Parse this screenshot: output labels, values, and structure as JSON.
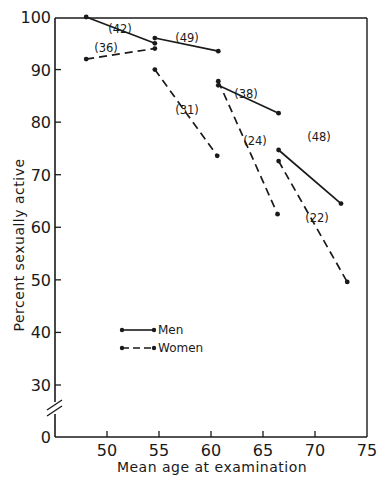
{
  "chart_data": {
    "type": "line",
    "title": "",
    "xlabel": "Mean age at examination",
    "ylabel": "Percent sexually active",
    "xlim": [
      45,
      75
    ],
    "ylim": [
      0,
      100
    ],
    "y_axis_break": "between 0 and 30",
    "x_ticks": [
      50,
      55,
      60,
      65,
      70,
      75
    ],
    "y_ticks": [
      0,
      30,
      40,
      50,
      60,
      70,
      80,
      90,
      100
    ],
    "grid": false,
    "legend_position": "lower left inside plot",
    "legend": [
      {
        "name": "Men",
        "style": "solid"
      },
      {
        "name": "Women",
        "style": "dashed"
      }
    ],
    "series": [
      {
        "name": "Men",
        "style": "solid",
        "segments": [
          {
            "label": "(42)",
            "points": [
              [
                48.0,
                100.0
              ],
              [
                54.6,
                95.0
              ]
            ]
          },
          {
            "label": "(49)",
            "points": [
              [
                54.6,
                96.0
              ],
              [
                60.7,
                93.5
              ]
            ]
          },
          {
            "label": "(38)",
            "points": [
              [
                60.7,
                87.0
              ],
              [
                66.5,
                81.7
              ]
            ]
          },
          {
            "label": "(48)",
            "points": [
              [
                66.5,
                74.7
              ],
              [
                72.5,
                64.5
              ]
            ]
          }
        ]
      },
      {
        "name": "Women",
        "style": "dashed",
        "segments": [
          {
            "label": "(36)",
            "points": [
              [
                48.0,
                92.0
              ],
              [
                54.6,
                94.0
              ]
            ]
          },
          {
            "label": "(31)",
            "points": [
              [
                54.6,
                90.0
              ],
              [
                60.6,
                73.6
              ]
            ]
          },
          {
            "label": "(24)",
            "points": [
              [
                60.7,
                87.8
              ],
              [
                66.4,
                62.5
              ]
            ]
          },
          {
            "label": "(22)",
            "points": [
              [
                66.5,
                72.6
              ],
              [
                73.1,
                49.6
              ]
            ]
          }
        ]
      }
    ]
  },
  "axes": {
    "x_title": "Mean age at examination",
    "y_title": "Percent sexually active"
  },
  "legend": {
    "men": "Men",
    "women": "Women"
  },
  "colors": {
    "ink": "#1a1a1a",
    "background": "#ffffff"
  }
}
